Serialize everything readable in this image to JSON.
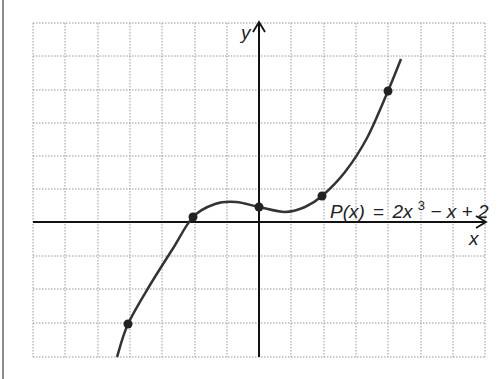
{
  "figure": {
    "x_axis_label": "x",
    "y_axis_label": "y",
    "equation": {
      "lhs": "P(x)",
      "equals": "=",
      "term1": "2x",
      "exponent": "3",
      "rest": "− x + 2"
    }
  },
  "grid": {
    "left": 33,
    "right": 485,
    "top": 23,
    "bottom": 357,
    "vertical_lines": [
      33,
      65,
      98,
      130,
      162,
      195,
      227,
      259,
      291,
      324,
      356,
      388,
      421,
      453,
      485
    ],
    "horizontal_lines": [
      23,
      56,
      90,
      123,
      156,
      189,
      222,
      256,
      289,
      323,
      357
    ]
  },
  "axes": {
    "origin_px": [
      259,
      222
    ]
  },
  "curve_points_px": [
    [
      117,
      357
    ],
    [
      128,
      324
    ],
    [
      150,
      285
    ],
    [
      172,
      250
    ],
    [
      193,
      217
    ],
    [
      215,
      204
    ],
    [
      236,
      202
    ],
    [
      259,
      207
    ],
    [
      285,
      212
    ],
    [
      305,
      207
    ],
    [
      322,
      196
    ],
    [
      345,
      172
    ],
    [
      367,
      138
    ],
    [
      388,
      91
    ],
    [
      401,
      59
    ]
  ],
  "marked_points_px": [
    [
      128,
      324
    ],
    [
      193,
      217
    ],
    [
      259,
      207
    ],
    [
      322,
      196
    ],
    [
      388,
      91
    ]
  ],
  "colors": {
    "curve": "#333333",
    "grid": "#999999",
    "axis": "#111111",
    "point": "#222222"
  }
}
